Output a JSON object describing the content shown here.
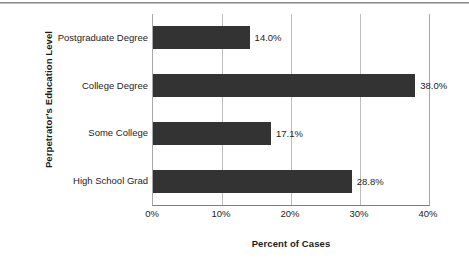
{
  "chart_data": {
    "type": "bar",
    "orientation": "horizontal",
    "title": "",
    "xlabel": "Percent of Cases",
    "ylabel": "Perpetrator's Education Level",
    "categories": [
      "Postgraduate Degree",
      "College Degree",
      "Some College",
      "High School Grad"
    ],
    "values": [
      14.0,
      38.0,
      17.1,
      28.8
    ],
    "value_labels": [
      "14.0%",
      "38.0%",
      "17.1%",
      "28.8%"
    ],
    "xlim": [
      0,
      40
    ],
    "xticks": [
      0,
      10,
      20,
      30,
      40
    ],
    "xtick_labels": [
      "0%",
      "10%",
      "20%",
      "30%",
      "40%"
    ],
    "grid": "vertical",
    "legend": "none",
    "bar_color": "#333333",
    "gridline_color": "#bcbcbc",
    "axis_color": "#7d7d7d",
    "text_color": "#1d1d1d",
    "background": "#ffffff"
  }
}
